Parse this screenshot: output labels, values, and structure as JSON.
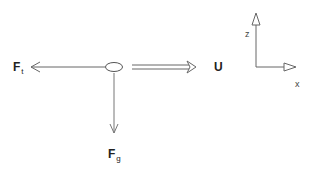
{
  "diagram": {
    "forces": {
      "friction": {
        "symbol": "F",
        "subscript": "t"
      },
      "gravity": {
        "symbol": "F",
        "subscript": "g"
      },
      "velocity": {
        "symbol": "U"
      }
    },
    "axes": {
      "vertical": "z",
      "horizontal": "x"
    },
    "colors": {
      "line": "#555555",
      "text": "#222222"
    }
  }
}
